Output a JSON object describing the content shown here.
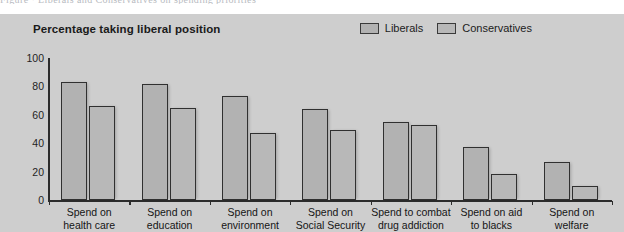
{
  "figure": {
    "cut_caption": "Figure · Liberals and Conservatives on spending priorities",
    "background_color": "#cecece",
    "bar_fill_color": "#b2b2b2",
    "bar_edge_color": "#303030",
    "axis_color": "#2c2c2c"
  },
  "legend": {
    "entries": [
      {
        "label": "Liberals",
        "color": "#b2b2b2"
      },
      {
        "label": "Conservatives",
        "color": "#b8b8b8"
      }
    ]
  },
  "chart_data": {
    "type": "bar",
    "title": "Percentage taking liberal position",
    "xlabel": "",
    "ylabel": "",
    "ylim": [
      0,
      100
    ],
    "yticks": [
      0,
      20,
      40,
      60,
      80,
      100
    ],
    "ytick_labels": [
      "0",
      "20",
      "40",
      "60",
      "80",
      "100"
    ],
    "grid": false,
    "legend_position": "top-right",
    "categories": [
      "Spend on health care",
      "Spend on education",
      "Spend on environment",
      "Spend on Social Security",
      "Spend to combat drug addiction",
      "Spend on aid to blacks",
      "Spend on welfare"
    ],
    "category_lines": [
      [
        "Spend on",
        "health care"
      ],
      [
        "Spend on",
        "education"
      ],
      [
        "Spend on",
        "environment"
      ],
      [
        "Spend on",
        "Social Security"
      ],
      [
        "Spend to combat",
        "drug addiction"
      ],
      [
        "Spend on aid",
        "to blacks"
      ],
      [
        "Spend on",
        "welfare"
      ]
    ],
    "series": [
      {
        "name": "Liberals",
        "values": [
          83,
          82,
          73,
          64,
          55,
          37,
          27
        ]
      },
      {
        "name": "Conservatives",
        "values": [
          66,
          65,
          47,
          49,
          53,
          18,
          10
        ]
      }
    ]
  }
}
